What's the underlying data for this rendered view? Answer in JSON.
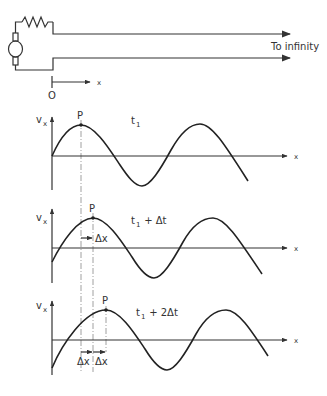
{
  "circuit": {
    "line_label": "To infinity",
    "origin_label": "O",
    "axis_label": "x"
  },
  "graphs": [
    {
      "y_label": "v",
      "y_sub": "x",
      "x_label": "x",
      "point_label": "P",
      "time_label": "t",
      "time_sub": "1",
      "time_suffix": ""
    },
    {
      "y_label": "v",
      "y_sub": "x",
      "x_label": "x",
      "point_label": "P",
      "time_label": "t",
      "time_sub": "1",
      "time_suffix": " + Δt",
      "shift_label": "Δx"
    },
    {
      "y_label": "v",
      "y_sub": "x",
      "x_label": "x",
      "point_label": "P",
      "time_label": "t",
      "time_sub": "1",
      "time_suffix": " + 2Δt",
      "shift_labels": [
        "Δx",
        "Δx"
      ]
    }
  ],
  "colors": {
    "ink": "#333333",
    "background": "#ffffff"
  }
}
